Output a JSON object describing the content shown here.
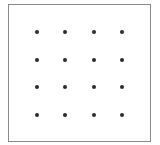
{
  "diagram": {
    "type": "dot-grid",
    "rows": 4,
    "columns": 4,
    "dot_color": "#2b2b2b",
    "border_color": "#8a8a8a",
    "dots": [
      {
        "row": 1,
        "col": 1,
        "x": 37,
        "y": 32
      },
      {
        "row": 1,
        "col": 2,
        "x": 65,
        "y": 32
      },
      {
        "row": 1,
        "col": 3,
        "x": 94,
        "y": 32
      },
      {
        "row": 1,
        "col": 4,
        "x": 122,
        "y": 32
      },
      {
        "row": 2,
        "col": 1,
        "x": 37,
        "y": 60
      },
      {
        "row": 2,
        "col": 2,
        "x": 65,
        "y": 60
      },
      {
        "row": 2,
        "col": 3,
        "x": 94,
        "y": 60
      },
      {
        "row": 2,
        "col": 4,
        "x": 122,
        "y": 60
      },
      {
        "row": 3,
        "col": 1,
        "x": 37,
        "y": 87
      },
      {
        "row": 3,
        "col": 2,
        "x": 65,
        "y": 87
      },
      {
        "row": 3,
        "col": 3,
        "x": 94,
        "y": 87
      },
      {
        "row": 3,
        "col": 4,
        "x": 122,
        "y": 87
      },
      {
        "row": 4,
        "col": 1,
        "x": 37,
        "y": 115
      },
      {
        "row": 4,
        "col": 2,
        "x": 65,
        "y": 115
      },
      {
        "row": 4,
        "col": 3,
        "x": 94,
        "y": 115
      },
      {
        "row": 4,
        "col": 4,
        "x": 122,
        "y": 115
      }
    ]
  }
}
